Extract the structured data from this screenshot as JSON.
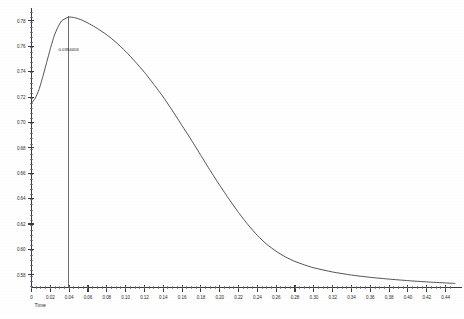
{
  "chart_data": {
    "type": "line",
    "title": "",
    "subtitle": "",
    "xlabel": "Time",
    "ylabel": "",
    "xlim": [
      0.0,
      0.45
    ],
    "ylim": [
      0.57,
      0.787
    ],
    "grid": false,
    "legend": null,
    "x_ticks": [
      "0",
      "0.02",
      "0.04",
      "0.06",
      "0.08",
      "0.10",
      "0.12",
      "0.14",
      "0.16",
      "0.18",
      "0.20",
      "0.22",
      "0.24",
      "0.26",
      "0.28",
      "0.30",
      "0.32",
      "0.34",
      "0.36",
      "0.38",
      "0.40",
      "0.42",
      "0.44"
    ],
    "x_tick_values": [
      0,
      0.02,
      0.04,
      0.06,
      0.08,
      0.1,
      0.12,
      0.14,
      0.16,
      0.18,
      0.2,
      0.22,
      0.24,
      0.26,
      0.28,
      0.3,
      0.32,
      0.34,
      0.36,
      0.38,
      0.4,
      0.42,
      0.44
    ],
    "y_ticks": [
      "0.78",
      "0.76",
      "0.74",
      "0.72",
      "0.70",
      "0.68",
      "0.66",
      "0.64",
      "0.62",
      "0.60",
      "0.58"
    ],
    "y_tick_values": [
      0.78,
      0.76,
      0.74,
      0.72,
      0.7,
      0.68,
      0.66,
      0.64,
      0.62,
      0.6,
      0.58
    ],
    "minor_ticks_per_major_x": 4,
    "minor_ticks_per_major_y": 5,
    "series": [
      {
        "name": "curve",
        "color": "#3d3d3d",
        "x": [
          0.0,
          0.004,
          0.008,
          0.012,
          0.016,
          0.02,
          0.024,
          0.028,
          0.032,
          0.0394,
          0.046,
          0.054,
          0.062,
          0.07,
          0.08,
          0.09,
          0.1,
          0.11,
          0.12,
          0.13,
          0.14,
          0.15,
          0.16,
          0.17,
          0.18,
          0.19,
          0.2,
          0.21,
          0.22,
          0.23,
          0.24,
          0.25,
          0.26,
          0.27,
          0.28,
          0.29,
          0.3,
          0.32,
          0.34,
          0.36,
          0.38,
          0.4,
          0.42,
          0.44,
          0.45
        ],
        "y": [
          0.7152,
          0.719,
          0.726,
          0.736,
          0.747,
          0.758,
          0.768,
          0.775,
          0.78,
          0.783,
          0.7825,
          0.7805,
          0.7775,
          0.774,
          0.769,
          0.763,
          0.756,
          0.748,
          0.7395,
          0.73,
          0.72,
          0.709,
          0.6975,
          0.686,
          0.674,
          0.662,
          0.6505,
          0.6395,
          0.629,
          0.6195,
          0.611,
          0.604,
          0.5985,
          0.594,
          0.5905,
          0.5878,
          0.5855,
          0.5822,
          0.5798,
          0.578,
          0.5766,
          0.5754,
          0.5744,
          0.5736,
          0.5732
        ]
      }
    ],
    "annotations": [
      {
        "label": "0.0394403",
        "x": 0.0394,
        "type": "vertical-marker",
        "description": "vertical line at peak location with value label"
      }
    ],
    "peak": {
      "x": 0.0394403,
      "y": 0.783
    }
  },
  "axes": {
    "x_axis_name": "time-axis",
    "y_axis_name": "value-axis"
  }
}
